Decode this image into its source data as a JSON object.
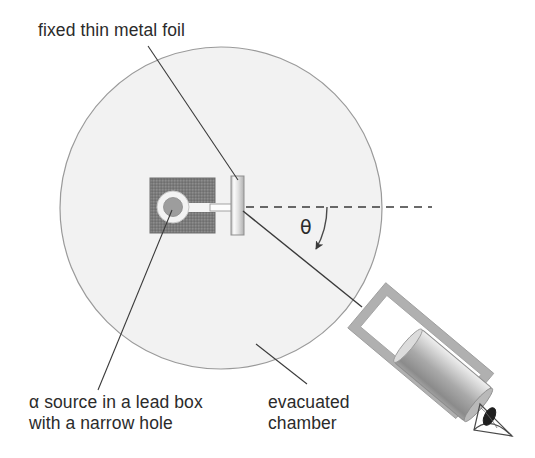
{
  "figure": {
    "background_color": "#ffffff",
    "width": 535,
    "height": 458
  },
  "labels": {
    "foil": "fixed thin metal foil",
    "source_line1": "α source in a lead box",
    "source_line2": "with a narrow hole",
    "chamber_line1": "evacuated",
    "chamber_line2": "chamber",
    "angle_symbol": "θ"
  },
  "colors": {
    "text": "#2b2b2b",
    "chamber_fill": "#f2f2f2",
    "chamber_stroke": "#9a9a9a",
    "lead_box_fill": "#7b7b7b",
    "lead_box_stroke": "#6a6a6a",
    "source_ring": "#f3f3f3",
    "source_core": "#9d9d9d",
    "foil_light": "#fbfbfb",
    "foil_mid": "#c9c9c9",
    "foil_stroke": "#8f8f8f",
    "detector_frame": "#c6c6c6",
    "detector_frame_stroke": "#9e9e9e",
    "detector_tube_light": "#e9e9e9",
    "detector_tube_dark": "#8e8e8e",
    "leader_line": "#3a3a3a",
    "beam_line": "#3a3a3a",
    "dashed_axis": "#3a3a3a"
  },
  "geometry": {
    "chamber": {
      "cx": 221,
      "cy": 208,
      "r": 161
    },
    "lead_box": {
      "x": 150,
      "y": 178,
      "width": 65,
      "height": 55
    },
    "source_hole": {
      "cx": 173,
      "cy": 207,
      "ring_r": 16,
      "core_r": 9
    },
    "collimator": {
      "x1": 173,
      "y1": 207,
      "x2": 236,
      "y2": 207
    },
    "foil": {
      "x": 231,
      "y": 176,
      "width": 13,
      "height": 59
    },
    "axis_dashed": {
      "x1": 244,
      "y1": 207,
      "x2": 432,
      "y2": 207
    },
    "scattered_beam": {
      "x1": 243,
      "y1": 211,
      "x2": 362,
      "y2": 307
    },
    "angle_arc_start": {
      "x": 327,
      "y": 207
    },
    "angle_arc_end": {
      "x": 317,
      "y": 251
    },
    "detector_angle_deg": 40,
    "eye": {
      "cx": 497,
      "cy": 420
    }
  },
  "leaders": {
    "foil_leader": {
      "x1": 148,
      "y1": 45,
      "x2": 237,
      "y2": 180
    },
    "source_leader": {
      "x1": 172,
      "y1": 209,
      "x2": 98,
      "y2": 391
    },
    "chamber_leader": {
      "x1": 306,
      "y1": 383,
      "x2": 256,
      "y2": 344
    }
  }
}
